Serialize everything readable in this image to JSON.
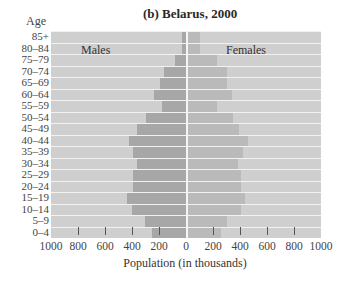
{
  "chart_data": {
    "type": "bar",
    "subtype": "population-pyramid",
    "title": "(b) Belarus, 2000",
    "ylabel": "Age",
    "xlabel": "Population (in thousands)",
    "categories": [
      "85+",
      "80–84",
      "75–79",
      "70–74",
      "65–69",
      "60–64",
      "55–59",
      "50–54",
      "45–49",
      "40–44",
      "35–39",
      "30–34",
      "25–29",
      "20–24",
      "15–19",
      "10–14",
      "5–9",
      "0–4"
    ],
    "series": [
      {
        "name": "Males",
        "values": [
          30,
          30,
          80,
          165,
          190,
          240,
          180,
          295,
          360,
          425,
          395,
          360,
          395,
          395,
          435,
          400,
          305,
          250
        ]
      },
      {
        "name": "Females",
        "values": [
          90,
          90,
          215,
          290,
          290,
          330,
          215,
          340,
          380,
          450,
          410,
          375,
          395,
          395,
          425,
          395,
          290,
          250
        ]
      }
    ],
    "xticks": [
      "1000",
      "800",
      "600",
      "400",
      "200",
      "0",
      "200",
      "400",
      "600",
      "800",
      "1000"
    ],
    "xlim": [
      -1000,
      1000
    ],
    "grid": false,
    "legend_position": "inline labels (Males left, Females right)"
  },
  "labels": {
    "title": "(b) Belarus, 2000",
    "age": "Age",
    "males": "Males",
    "females": "Females",
    "xlabel": "Population (in thousands)"
  },
  "colors": {
    "background": "#cfcfcf",
    "males": "#a7a7a7",
    "females": "#bababa",
    "separator": "#f2f2f2"
  }
}
